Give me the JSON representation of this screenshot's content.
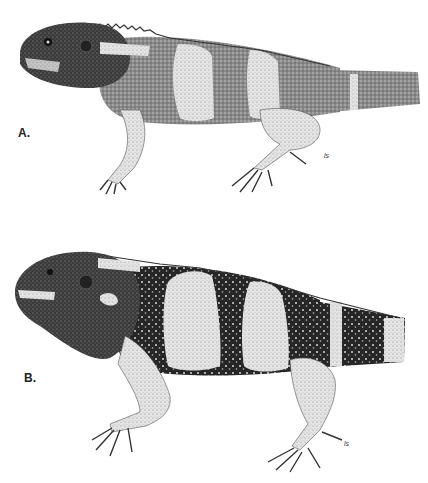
{
  "figure": {
    "panels": [
      {
        "label": "A.",
        "signature": "ls",
        "description": "lizard-lateral-view-juvenile-banded"
      },
      {
        "label": "B.",
        "signature": "ls",
        "description": "lizard-lateral-view-adult-banded"
      }
    ],
    "colors": {
      "background": "#ffffff",
      "ink_dark": "#1e1e1e",
      "ink_mid": "#5a5a5a",
      "ink_light": "#c8c8c8",
      "band_light": "#e6e6e6"
    }
  }
}
